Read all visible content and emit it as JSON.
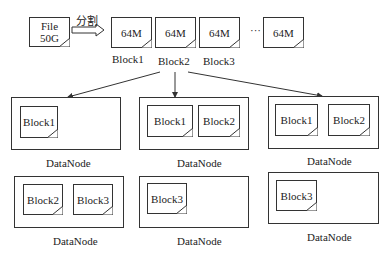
{
  "diagram": {
    "file": {
      "line1": "File",
      "line2": "50G"
    },
    "split_label": "分割",
    "top_blocks": [
      {
        "size": "64M",
        "label": "Block1"
      },
      {
        "size": "64M",
        "label": "Block2"
      },
      {
        "size": "64M",
        "label": "Block3"
      },
      {
        "size": "64M",
        "label": ""
      }
    ],
    "ellipsis": "···",
    "datanodes": [
      {
        "label": "DataNode",
        "blocks": [
          "Block1"
        ]
      },
      {
        "label": "DataNode",
        "blocks": [
          "Block1",
          "Block2"
        ]
      },
      {
        "label": "DataNode",
        "blocks": [
          "Block1",
          "Block2"
        ]
      },
      {
        "label": "DataNode",
        "blocks": [
          "Block2",
          "Block3"
        ]
      },
      {
        "label": "DataNode",
        "blocks": [
          "Block3"
        ]
      },
      {
        "label": "DataNode",
        "blocks": [
          "Block3"
        ]
      }
    ]
  }
}
